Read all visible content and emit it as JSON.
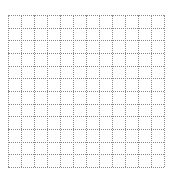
{
  "title": "",
  "grid": {
    "columns": 12,
    "rows": 12,
    "line_color": "#8a8a8a",
    "line_style": "dotted",
    "background": "#ffffff"
  }
}
